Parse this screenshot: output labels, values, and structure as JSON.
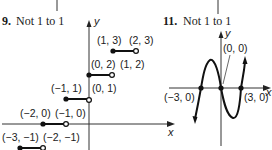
{
  "problems": [
    {
      "number": "9.",
      "answer": "Not 1 to 1",
      "axis_labels": {
        "x": "x",
        "y": "y"
      },
      "segments": [
        {
          "closed_label": "(1, 3)",
          "open_label": "(2, 3)"
        },
        {
          "closed_label": "(0, 2)",
          "open_label": "(1, 2)"
        },
        {
          "closed_label": "(−1, 1)",
          "open_label": "(0, 1)"
        },
        {
          "closed_label": "(−2, 0)",
          "open_label": "(−1, 0)"
        },
        {
          "closed_label": "(−3, −1)",
          "open_label": "(−2, −1)"
        }
      ]
    },
    {
      "number": "11.",
      "answer": "Not 1 to 1",
      "axis_labels": {
        "x": "x",
        "y": "y"
      },
      "points": [
        {
          "label": "(0, 0)"
        },
        {
          "label": "(−3, 0)"
        },
        {
          "label": "(3, 0)"
        }
      ]
    }
  ],
  "colors": {
    "ink": "#1a1a1a",
    "background": "#ffffff"
  }
}
